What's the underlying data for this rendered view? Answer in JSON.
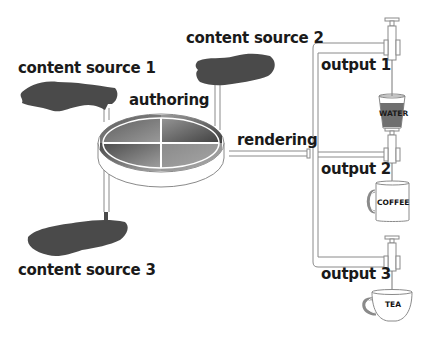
{
  "diagram": {
    "colors": {
      "blob": "#4a4a4a",
      "pipe_stroke": "#888888",
      "disk_rim": "#ffffff",
      "water": "#6f6f6f",
      "text": "#1a1a1a"
    },
    "sources": [
      {
        "id": "source-1",
        "label": "content source 1"
      },
      {
        "id": "source-2",
        "label": "content source 2"
      },
      {
        "id": "source-3",
        "label": "content source 3"
      }
    ],
    "hub": {
      "label_authoring": "authoring",
      "label_rendering": "rendering",
      "segments": 4
    },
    "outputs": [
      {
        "id": "output-1",
        "label": "output 1",
        "vessel": "glass",
        "vessel_label": "WATER"
      },
      {
        "id": "output-2",
        "label": "output 2",
        "vessel": "mug",
        "vessel_label": "COFFEE"
      },
      {
        "id": "output-3",
        "label": "output 3",
        "vessel": "teacup",
        "vessel_label": "TEA"
      }
    ]
  }
}
